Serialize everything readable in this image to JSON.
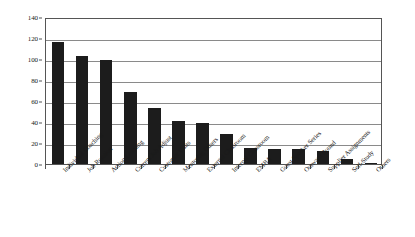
{
  "chart_data": {
    "type": "bar",
    "title": "",
    "subtitle": "",
    "xlabel": "",
    "ylabel": "",
    "ylim": [
      0,
      140
    ],
    "ytick_step": 20,
    "yticks": [
      0,
      20,
      40,
      60,
      80,
      100,
      120,
      140
    ],
    "grid": true,
    "legend": false,
    "legend_position": "none",
    "orientation": "vertical",
    "bar_color": "#1c1c1c",
    "categories": [
      "Individual Coaching",
      "Job Rotation",
      "Action Learning",
      "Current Job Adjust",
      "Customer Visits",
      "Mentoring Others",
      "External Classroom",
      "Internal Classroom",
      "EMBA",
      "Guest Speaker Series",
      "Outward Bound",
      "Supplier Assignments",
      "Self-Study",
      "Others"
    ],
    "values": [
      116,
      103,
      99,
      69,
      53,
      41,
      39,
      29,
      15,
      14,
      14,
      12,
      5,
      1
    ]
  },
  "colors": {
    "bar": "#1c1c1c",
    "grid": "#8a8a8a",
    "axis": "#555555",
    "background": "#ffffff",
    "text": "#1a1a1a"
  }
}
